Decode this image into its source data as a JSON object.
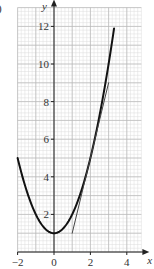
{
  "part_label": ")",
  "chart_data": {
    "type": "line",
    "title": "",
    "xlabel": "x",
    "ylabel": "y",
    "xlim": [
      -2,
      4.8
    ],
    "ylim": [
      0,
      13
    ],
    "grid": true,
    "grid_minor_step": 0.2,
    "grid_major_step_x": 1,
    "grid_major_step_y": 1,
    "x_ticks": [
      -2,
      0,
      2,
      4
    ],
    "x_tick_labels": [
      "−2",
      "0",
      "2",
      "4"
    ],
    "y_ticks": [
      2,
      4,
      6,
      8,
      10,
      12
    ],
    "y_tick_labels": [
      "2",
      "4",
      "6",
      "8",
      "10",
      "12"
    ],
    "legend": null,
    "series": [
      {
        "name": "curve y = x² + 1",
        "color": "#111111",
        "width": 2,
        "x": [
          -2,
          -1.5,
          -1,
          -0.5,
          0,
          0.5,
          1,
          1.5,
          2,
          2.5,
          3,
          3.3
        ],
        "y": [
          5,
          3.25,
          2,
          1.25,
          1,
          1.25,
          2,
          3.25,
          5,
          7.25,
          10,
          11.89
        ]
      },
      {
        "name": "tangent at x = 2 (y = 4x − 3)",
        "color": "#444444",
        "width": 1,
        "x": [
          1,
          3
        ],
        "y": [
          1,
          9
        ]
      }
    ]
  }
}
